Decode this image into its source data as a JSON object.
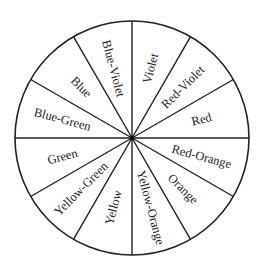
{
  "diagram": {
    "center": [
      132,
      138
    ],
    "radius": 117,
    "label_radius": 72,
    "stroke_color": "#222222",
    "segments": [
      {
        "label": "Violet",
        "mid_angle": 15
      },
      {
        "label": "Red-Violet",
        "mid_angle": 45
      },
      {
        "label": "Red",
        "mid_angle": 75
      },
      {
        "label": "Red-Orange",
        "mid_angle": 105
      },
      {
        "label": "Orange",
        "mid_angle": 135
      },
      {
        "label": "Yellow-Orange",
        "mid_angle": 165
      },
      {
        "label": "Yellow",
        "mid_angle": 195
      },
      {
        "label": "Yellow-Green",
        "mid_angle": 225
      },
      {
        "label": "Green",
        "mid_angle": 255
      },
      {
        "label": "Blue-Green",
        "mid_angle": 285
      },
      {
        "label": "Blue",
        "mid_angle": 315
      },
      {
        "label": "Blue-Violet",
        "mid_angle": 345
      }
    ]
  }
}
